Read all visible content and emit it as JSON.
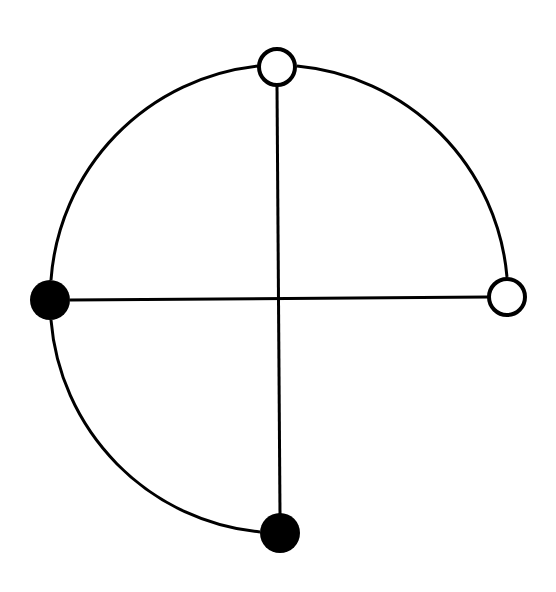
{
  "diagram": {
    "colors": {
      "stroke": "#000000",
      "filled": "#000000",
      "open": "#ffffff",
      "background": "#ffffff"
    },
    "nodes": [
      {
        "id": "top",
        "type": "open",
        "x": 277,
        "y": 67
      },
      {
        "id": "right",
        "type": "open",
        "x": 507,
        "y": 297
      },
      {
        "id": "left",
        "type": "filled",
        "x": 50,
        "y": 300
      },
      {
        "id": "bottom",
        "type": "filled",
        "x": 280,
        "y": 533
      }
    ],
    "edges": [
      {
        "from": "top",
        "to": "left",
        "kind": "arc"
      },
      {
        "from": "left",
        "to": "bottom",
        "kind": "arc"
      },
      {
        "from": "top",
        "to": "right",
        "kind": "arc"
      },
      {
        "from": "top",
        "to": "bottom",
        "kind": "line"
      },
      {
        "from": "left",
        "to": "right",
        "kind": "line"
      }
    ]
  }
}
